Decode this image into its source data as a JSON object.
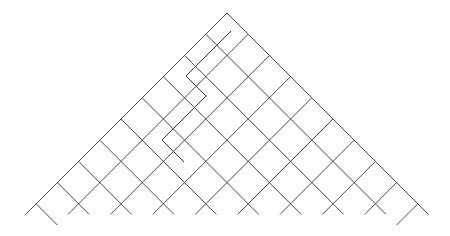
{
  "diagram": {
    "type": "triangular-lattice-with-path",
    "width": 450,
    "height": 236,
    "background": "#ffffff",
    "line_color": "#4a4a4a",
    "path_color": "#3a3a3a",
    "apex": [
      227,
      13
    ],
    "step": 21.2,
    "rows": 9,
    "down_left_lines": [
      [
        [
          227,
          13
        ],
        [
          25.6,
          214.4
        ]
      ],
      [
        [
          248.2,
          34.2
        ],
        [
          68,
          214.4
        ]
      ],
      [
        [
          269.4,
          55.4
        ],
        [
          110.4,
          214.4
        ]
      ],
      [
        [
          290.6,
          76.6
        ],
        [
          152.8,
          214.4
        ]
      ],
      [
        [
          311.8,
          97.8
        ],
        [
          195.2,
          214.4
        ]
      ],
      [
        [
          333,
          119
        ],
        [
          237.6,
          214.4
        ]
      ],
      [
        [
          354.2,
          140.2
        ],
        [
          280,
          214.4
        ]
      ],
      [
        [
          375.4,
          161.4
        ],
        [
          322.4,
          214.4
        ]
      ],
      [
        [
          396.6,
          182.6
        ],
        [
          364.8,
          214.4
        ]
      ],
      [
        [
          417.8,
          203.8
        ],
        [
          396.6,
          225
        ]
      ]
    ],
    "down_right_lines": [
      [
        [
          227,
          13
        ],
        [
          428.4,
          214.4
        ]
      ],
      [
        [
          205.8,
          34.2
        ],
        [
          386,
          214.4
        ]
      ],
      [
        [
          184.6,
          55.4
        ],
        [
          343.6,
          214.4
        ]
      ],
      [
        [
          163.4,
          76.6
        ],
        [
          301.2,
          214.4
        ]
      ],
      [
        [
          142.2,
          97.8
        ],
        [
          258.8,
          214.4
        ]
      ],
      [
        [
          121,
          119
        ],
        [
          216.4,
          214.4
        ]
      ],
      [
        [
          99.8,
          140.2
        ],
        [
          174,
          214.4
        ]
      ],
      [
        [
          78.6,
          161.4
        ],
        [
          131.6,
          214.4
        ]
      ],
      [
        [
          57.4,
          182.6
        ],
        [
          89.2,
          214.4
        ]
      ],
      [
        [
          36.2,
          203.8
        ],
        [
          57.4,
          225
        ]
      ]
    ],
    "path": [
      [
        231,
        31
      ],
      [
        186,
        76
      ],
      [
        206,
        96
      ],
      [
        162,
        140
      ],
      [
        184,
        162
      ]
    ]
  }
}
